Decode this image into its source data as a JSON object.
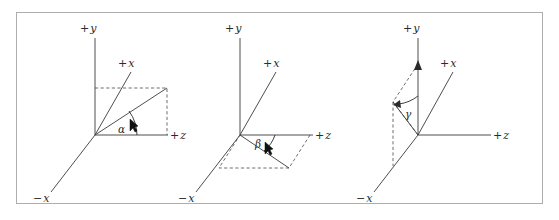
{
  "figure": {
    "caption": "",
    "panel_count": 3,
    "background_color": "#ffffff",
    "frame_color": "#adadad",
    "line_color": "#3a3a3a",
    "dash_color": "#4a4a4a"
  },
  "panels": [
    {
      "id": "panel-alpha",
      "angle_symbol": "α",
      "origin": {
        "x": 95,
        "y": 135
      },
      "axes": [
        {
          "name": "y-positive",
          "label_sign": "+",
          "label_var": "y",
          "label_x": 84,
          "label_y": 32,
          "end_x": 95,
          "end_y": 38
        },
        {
          "name": "x-positive",
          "label_sign": "+",
          "label_var": "x",
          "label_x": 122,
          "label_y": 67,
          "end_x": 131,
          "end_y": 72
        },
        {
          "name": "z-positive",
          "label_sign": "+",
          "label_var": "z",
          "label_x": 172,
          "label_y": 139,
          "end_x": 168,
          "end_y": 135
        },
        {
          "name": "x-negative",
          "label_sign": "−",
          "label_var": "x",
          "label_x": 38,
          "label_y": 202,
          "end_x": 51,
          "end_y": 192
        }
      ],
      "vector": {
        "end_x": 167,
        "end_y": 88
      },
      "projection_box": {
        "top_left_x": 95,
        "top_left_y": 88,
        "top_right_x": 167,
        "top_right_y": 88,
        "bottom_right_x": 167,
        "bottom_right_y": 135
      }
    },
    {
      "id": "panel-beta",
      "angle_symbol": "β",
      "origin": {
        "x": 240,
        "y": 135
      },
      "axes": [
        {
          "name": "y-positive",
          "label_sign": "+",
          "label_var": "y",
          "label_x": 229,
          "label_y": 32,
          "end_x": 240,
          "end_y": 38
        },
        {
          "name": "x-positive",
          "label_sign": "+",
          "label_var": "x",
          "label_x": 267,
          "label_y": 67,
          "end_x": 276,
          "end_y": 72
        },
        {
          "name": "z-positive",
          "label_sign": "+",
          "label_var": "z",
          "label_x": 317,
          "label_y": 139,
          "end_x": 313,
          "end_y": 135
        },
        {
          "name": "x-negative",
          "label_sign": "−",
          "label_var": "x",
          "label_x": 183,
          "label_y": 202,
          "end_x": 196,
          "end_y": 192
        }
      ],
      "vector": {
        "end_x": 289,
        "end_y": 168
      },
      "projection_parallelogram": [
        {
          "x": 240,
          "y": 135
        },
        {
          "x": 310,
          "y": 135
        },
        {
          "x": 289,
          "y": 168
        },
        {
          "x": 219,
          "y": 168
        }
      ]
    },
    {
      "id": "panel-gamma",
      "angle_symbol": "γ",
      "origin": {
        "x": 418,
        "y": 135
      },
      "axes": [
        {
          "name": "y-positive",
          "label_sign": "+",
          "label_var": "y",
          "label_x": 407,
          "label_y": 32,
          "end_x": 418,
          "end_y": 38
        },
        {
          "name": "x-positive",
          "label_sign": "+",
          "label_var": "x",
          "label_x": 444,
          "label_y": 67,
          "end_x": 453,
          "end_y": 72
        },
        {
          "name": "z-positive",
          "label_sign": "+",
          "label_var": "z",
          "label_x": 495,
          "label_y": 139,
          "end_x": 491,
          "end_y": 135
        },
        {
          "name": "x-negative",
          "label_sign": "−",
          "label_var": "x",
          "label_x": 361,
          "label_y": 202,
          "end_x": 374,
          "end_y": 192
        }
      ],
      "vector": {
        "end_x": 393,
        "end_y": 102
      },
      "projection_quad": [
        {
          "x": 418,
          "y": 135
        },
        {
          "x": 393,
          "y": 102
        },
        {
          "x": 418,
          "y": 64
        },
        {
          "x": 393,
          "y": 166
        }
      ]
    }
  ],
  "labels": {
    "plus": "+",
    "minus": "−",
    "axis_x": "x",
    "axis_y": "y",
    "axis_z": "z",
    "alpha": "α",
    "beta": "β",
    "gamma": "γ"
  }
}
